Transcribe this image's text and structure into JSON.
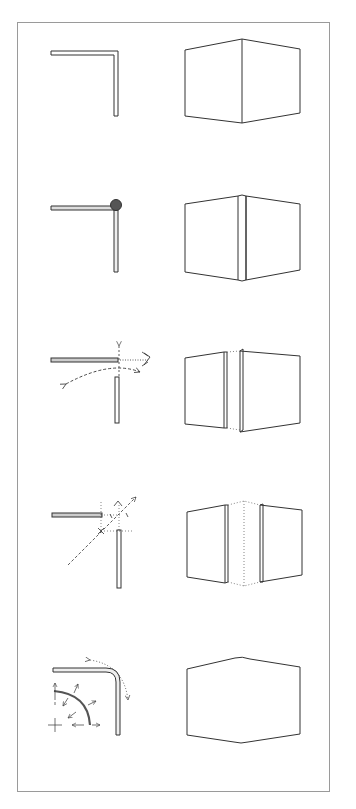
{
  "figure": {
    "stroke_color": "#333333",
    "frame_color": "#9a9a9a",
    "ball_color": "#555555",
    "rows": [
      {
        "index": 1,
        "plan": "plain-mitred-corner",
        "perspective": "box-sharp-corner"
      },
      {
        "index": 2,
        "plan": "corner-with-ball-joint",
        "perspective": "box-with-corner-post"
      },
      {
        "index": 3,
        "plan": "corner-separated-with-rotation-arrows",
        "perspective": "box-split-panels-gap"
      },
      {
        "index": 4,
        "plan": "corner-offset-with-diagonal-axis",
        "perspective": "box-panels-apart-dotted-corner"
      },
      {
        "index": 5,
        "plan": "rounded-corner-with-radius-arrows",
        "perspective": "box-rounded-edges"
      }
    ]
  }
}
